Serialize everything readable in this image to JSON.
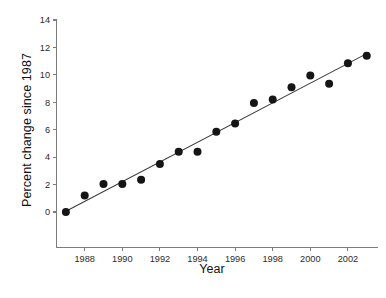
{
  "chart_data": {
    "type": "scatter",
    "title": "",
    "xlabel": "Year",
    "ylabel": "Percent change since 1987",
    "x": [
      1987,
      1988,
      1989,
      1990,
      1991,
      1992,
      1993,
      1994,
      1995,
      1996,
      1997,
      1998,
      1999,
      2000,
      2001,
      2002,
      2003
    ],
    "values": [
      0.0,
      1.2,
      2.05,
      2.05,
      2.35,
      3.5,
      4.4,
      4.4,
      5.85,
      6.45,
      7.95,
      8.2,
      9.1,
      9.95,
      9.35,
      10.85,
      11.4
    ],
    "series": [
      {
        "name": "Percent change since 1987",
        "marker": "filled-circle",
        "color": "#151515",
        "values": [
          0.0,
          1.2,
          2.05,
          2.05,
          2.35,
          3.5,
          4.4,
          4.4,
          5.85,
          6.45,
          7.95,
          8.2,
          9.1,
          9.95,
          9.35,
          10.85,
          11.4
        ]
      },
      {
        "name": "linear fit",
        "type": "line",
        "color": "#3a3a3a",
        "x": [
          1987,
          2003
        ],
        "values": [
          0.05,
          11.55
        ]
      }
    ],
    "xlim": [
      1986.5,
      2003.6
    ],
    "ylim": [
      -2.6,
      14.4
    ],
    "xticks": [
      1988,
      1990,
      1992,
      1994,
      1996,
      1998,
      2000,
      2002
    ],
    "xtick_labels": [
      "1988",
      "1990",
      "1992",
      "1994",
      "1996",
      "1998",
      "2000",
      "2002"
    ],
    "yticks": [
      0,
      2,
      4,
      6,
      8,
      10,
      12,
      14
    ],
    "ytick_labels": [
      "0",
      "2",
      "4",
      "6",
      "8",
      "10",
      "12",
      "14"
    ],
    "grid": false,
    "legend": "none",
    "annotations": []
  },
  "axes": {
    "x_title": "Year",
    "y_title": "Percent change since 1987"
  },
  "colors": {
    "marker": "#151515",
    "fit_line": "#3a3a3a",
    "axis": "#7d7d7d",
    "background": "#ffffff",
    "text": "#111111"
  }
}
